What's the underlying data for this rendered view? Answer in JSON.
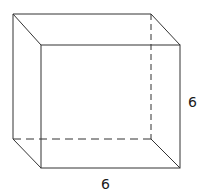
{
  "figure": {
    "type": "rectangular prism (cube) wireframe",
    "stroke_color": "#333333",
    "hidden_edge_style": "dashed",
    "vertices": {
      "back_top_left": [
        13,
        14
      ],
      "back_top_right": [
        151,
        14
      ],
      "back_bottom_left": [
        13,
        139
      ],
      "back_bottom_right": [
        151,
        139
      ],
      "front_top_left": [
        41,
        45
      ],
      "front_top_right": [
        180,
        45
      ],
      "front_bottom_left": [
        41,
        168
      ],
      "front_bottom_right": [
        180,
        168
      ]
    }
  },
  "labels": {
    "height": "6",
    "width": "6"
  }
}
